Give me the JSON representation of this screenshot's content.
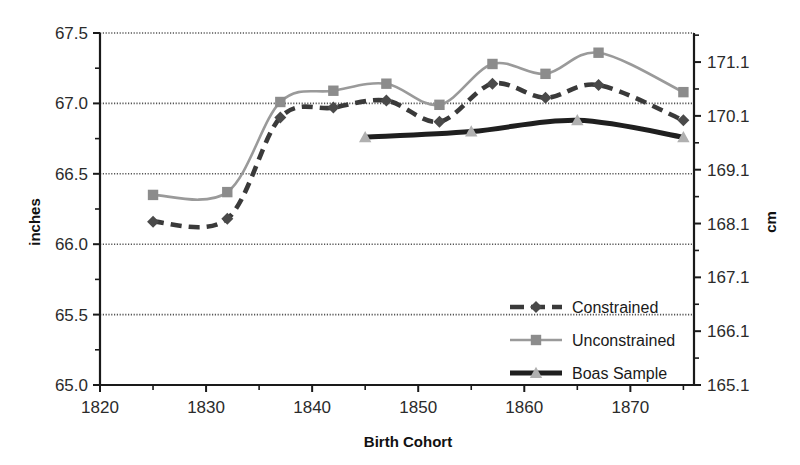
{
  "chart_data": {
    "type": "line",
    "title": "",
    "xlabel": "Birth Cohort",
    "ylabel": "inches",
    "y2label": "cm",
    "xlim": [
      1820,
      1876
    ],
    "ylim": [
      65.0,
      67.5
    ],
    "y2lim": [
      165.1,
      171.64
    ],
    "grid": true,
    "gridlines_y": [
      65.5,
      66.0,
      66.5,
      67.0,
      67.5
    ],
    "xticks": [
      1820,
      1830,
      1840,
      1850,
      1860,
      1870
    ],
    "xtick_labels": [
      "1820",
      "1830",
      "1840",
      "1850",
      "1860",
      "1870"
    ],
    "xticks_minor": [
      1825,
      1835,
      1845,
      1855,
      1865,
      1875
    ],
    "yticks": [
      65.0,
      65.5,
      66.0,
      66.5,
      67.0,
      67.5
    ],
    "ytick_labels": [
      "65.0",
      "65.5",
      "66.0",
      "66.5",
      "67.0",
      "67.5"
    ],
    "yticks_minor": [
      65.25,
      65.75,
      66.25,
      66.75,
      67.25
    ],
    "y2ticks": [
      165.1,
      166.1,
      167.1,
      168.1,
      169.1,
      170.1,
      171.1
    ],
    "y2tick_labels": [
      "165.1",
      "166.1",
      "167.1",
      "168.1",
      "169.1",
      "170.1",
      "171.1"
    ],
    "legend_position": "center-right-inside",
    "series": [
      {
        "name": "Constrained",
        "color": "#3a3a3a",
        "line_style": "dashed",
        "marker": "diamond",
        "marker_color": "#4a4a4a",
        "x": [
          1825,
          1832,
          1837,
          1842,
          1847,
          1852,
          1857,
          1862,
          1867,
          1875
        ],
        "y": [
          66.16,
          66.18,
          66.9,
          66.97,
          67.02,
          66.87,
          67.14,
          67.04,
          67.13,
          66.88
        ]
      },
      {
        "name": "Unconstrained",
        "color": "#9a9a9a",
        "line_style": "solid",
        "marker": "square",
        "marker_color": "#8c8c8c",
        "x": [
          1825,
          1832,
          1837,
          1842,
          1847,
          1852,
          1857,
          1862,
          1867,
          1875
        ],
        "y": [
          66.35,
          66.37,
          67.01,
          67.09,
          67.14,
          66.99,
          67.28,
          67.21,
          67.36,
          67.08
        ]
      },
      {
        "name": "Boas Sample",
        "color": "#1f1f1f",
        "line_style": "solid-thick",
        "marker": "triangle",
        "marker_color": "#b0b0b0",
        "x": [
          1845,
          1855,
          1865,
          1875
        ],
        "y": [
          66.76,
          66.8,
          66.88,
          66.76
        ]
      }
    ]
  },
  "legend": {
    "items": [
      {
        "label": "Constrained"
      },
      {
        "label": "Unconstrained"
      },
      {
        "label": "Boas Sample"
      }
    ]
  }
}
